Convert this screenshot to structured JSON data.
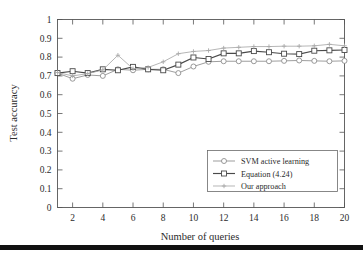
{
  "chart_data": {
    "type": "line",
    "title": "",
    "xlabel": "Number of queries",
    "ylabel": "Test accuracy",
    "xlim": [
      1,
      20
    ],
    "ylim": [
      0,
      1
    ],
    "grid": false,
    "legend_position": "lower-right",
    "x": [
      1,
      2,
      3,
      4,
      5,
      6,
      7,
      8,
      9,
      10,
      11,
      12,
      13,
      14,
      15,
      16,
      17,
      18,
      19,
      20
    ],
    "xticks": [
      2,
      4,
      6,
      8,
      10,
      12,
      14,
      16,
      18,
      20
    ],
    "yticks": [
      0,
      0.1,
      0.2,
      0.3,
      0.4,
      0.5,
      0.6,
      0.7,
      0.8,
      0.9,
      1
    ],
    "ytick_labels": [
      "0",
      "0.1",
      "0.2",
      "0.3",
      "0.4",
      "0.5",
      "0.6",
      "0.7",
      "0.8",
      "0.9",
      "1"
    ],
    "xtick_labels": [
      "2",
      "4",
      "6",
      "8",
      "10",
      "12",
      "14",
      "16",
      "18",
      "20"
    ],
    "series": [
      {
        "name": "SVM active learning",
        "marker": "circle",
        "color": "#8d8d8d",
        "values": [
          0.715,
          0.685,
          0.705,
          0.7,
          0.735,
          0.73,
          0.735,
          0.735,
          0.715,
          0.75,
          0.775,
          0.778,
          0.778,
          0.778,
          0.778,
          0.78,
          0.782,
          0.78,
          0.778,
          0.78
        ]
      },
      {
        "name": "Equation (4.24)",
        "marker": "square",
        "color": "#4a4a4a",
        "values": [
          0.715,
          0.725,
          0.715,
          0.735,
          0.73,
          0.748,
          0.735,
          0.73,
          0.76,
          0.798,
          0.79,
          0.82,
          0.82,
          0.832,
          0.826,
          0.818,
          0.816,
          0.834,
          0.836,
          0.838
        ]
      },
      {
        "name": "Our approach",
        "marker": "plus",
        "color": "#a9a9a9",
        "values": [
          0.718,
          0.7,
          0.712,
          0.732,
          0.81,
          0.738,
          0.745,
          0.775,
          0.818,
          0.83,
          0.835,
          0.848,
          0.852,
          0.856,
          0.856,
          0.858,
          0.858,
          0.86,
          0.868,
          0.86
        ]
      }
    ]
  },
  "legend": {
    "entries": [
      {
        "label": "SVM active learning"
      },
      {
        "label": "Equation (4.24)"
      },
      {
        "label": "Our approach"
      }
    ]
  }
}
